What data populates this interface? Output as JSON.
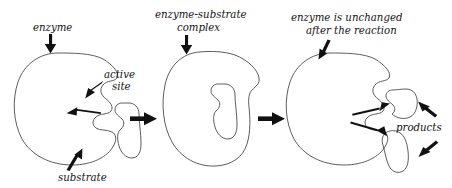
{
  "figure": {
    "background_color": "#ffffff",
    "ink_color": "#111111",
    "width": 452,
    "height": 188
  },
  "labels": {
    "enzyme": "enzyme",
    "active": "active",
    "site": "site",
    "substrate": "substrate",
    "complex_line1": "enzyme-substrate",
    "complex_line2": "complex",
    "unchanged_line1": "enzyme is unchanged",
    "unchanged_line2": "after the reaction",
    "products": "products"
  },
  "stages": [
    {
      "name": "stage-1-enzyme-and-substrate",
      "callouts": [
        "enzyme",
        "active site",
        "substrate"
      ]
    },
    {
      "name": "stage-2-enzyme-substrate-complex",
      "callouts": [
        "enzyme-substrate complex"
      ]
    },
    {
      "name": "stage-3-products-released",
      "callouts": [
        "enzyme is unchanged after the reaction",
        "products"
      ]
    }
  ],
  "shapes": {
    "enzyme_gradient_dark": "#2b2b2b",
    "enzyme_gradient_light": "#fdfdfd",
    "substrate_gradient_dark": "#3a3a3a",
    "substrate_gradient_light": "#f6f6f6",
    "outline_color": "#4a4a4a"
  },
  "transition_arrows": [
    {
      "name": "arrow-stage1-to-stage2"
    },
    {
      "name": "arrow-stage2-to-stage3"
    }
  ],
  "callout_arrows": [
    {
      "name": "callout-arrow-enzyme",
      "direction": "down"
    },
    {
      "name": "callout-arrow-active-site",
      "direction": "down-left"
    },
    {
      "name": "callout-arrow-active-site-inner",
      "direction": "left"
    },
    {
      "name": "callout-arrow-substrate",
      "direction": "up-right"
    },
    {
      "name": "callout-arrow-complex",
      "direction": "down"
    },
    {
      "name": "callout-arrow-unchanged",
      "direction": "down-left"
    },
    {
      "name": "callout-arrow-product-upper",
      "direction": "up-left"
    },
    {
      "name": "callout-arrow-product-lower",
      "direction": "down-left"
    },
    {
      "name": "release-arrow-upper",
      "direction": "up-right"
    },
    {
      "name": "release-arrow-lower",
      "direction": "down-right"
    }
  ]
}
